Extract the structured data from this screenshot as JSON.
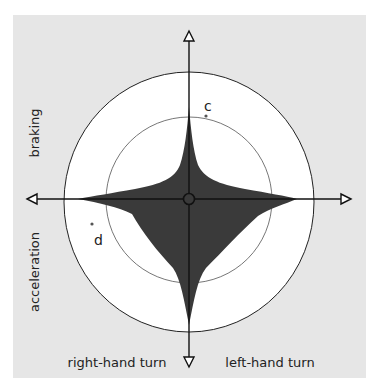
{
  "diagram": {
    "labels": {
      "braking": "braking",
      "acceleration": "acceleration",
      "right_turn": "right-hand turn",
      "left_turn": "left-hand turn",
      "point_c": "c",
      "point_d": "d"
    },
    "colors": {
      "panel_background": "#e6e6e6",
      "circle_fill": "#ffffff",
      "star_fill": "#3a3a3a",
      "axis_color": "#111111",
      "inner_circle_stroke": "#777777",
      "point_color": "#555555"
    },
    "axes": {
      "vertical": "braking (up) / acceleration (down)",
      "horizontal": "right-hand turn (left) / left-hand turn (right)"
    }
  }
}
